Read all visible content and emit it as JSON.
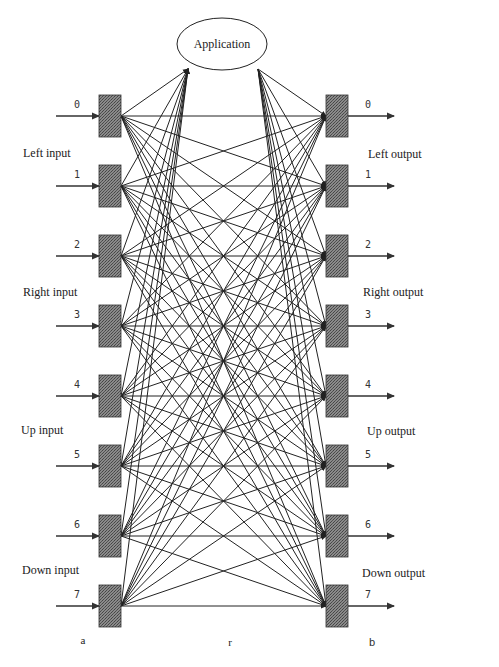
{
  "diagram": {
    "type": "crossbar-interconnect",
    "application_node": {
      "label": "Application"
    },
    "input_ports": [
      {
        "index": "0"
      },
      {
        "index": "1"
      },
      {
        "index": "2"
      },
      {
        "index": "3"
      },
      {
        "index": "4"
      },
      {
        "index": "5"
      },
      {
        "index": "6"
      },
      {
        "index": "7"
      }
    ],
    "output_ports": [
      {
        "index": "0"
      },
      {
        "index": "1"
      },
      {
        "index": "2"
      },
      {
        "index": "3"
      },
      {
        "index": "4"
      },
      {
        "index": "5"
      },
      {
        "index": "6"
      },
      {
        "index": "7"
      }
    ],
    "input_groups": [
      {
        "label": "Left input"
      },
      {
        "label": "Right input"
      },
      {
        "label": "Up input"
      },
      {
        "label": "Down input"
      }
    ],
    "output_groups": [
      {
        "label": "Left output"
      },
      {
        "label": "Right output"
      },
      {
        "label": "Up output"
      },
      {
        "label": "Down output"
      }
    ],
    "column_labels": {
      "input": "a",
      "router": "r",
      "output": "b"
    },
    "connections": "full mesh: every input port connects to every output port and to Application; Application connects to every output port",
    "colors": {
      "line": "#222222",
      "box_fill": "#666666",
      "background": "#ffffff"
    }
  }
}
